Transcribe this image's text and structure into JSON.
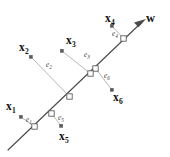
{
  "figure": {
    "background_color": "#ffffff",
    "width": 170,
    "height": 157,
    "axis_color": "#4a4a4a",
    "residual_color": "#b3b3b3",
    "marker_fill": "#ffffff",
    "marker_stroke": "#555555",
    "data_point_color": "#5c5c5c",
    "label_color": "#111111"
  },
  "principal_axis": {
    "name": "principal-axis",
    "label": "w",
    "has_arrowhead": true,
    "arrow_direction": "up-right",
    "start": {
      "x": 8,
      "y": 150
    },
    "end": {
      "x": 146,
      "y": 19
    }
  },
  "data_points": [
    {
      "id": "x1",
      "label": "x",
      "subscript": "1",
      "point": {
        "x": 21,
        "y": 117
      },
      "label_pos": {
        "x": 6,
        "y": 101
      },
      "projection": {
        "x": 35,
        "y": 127
      },
      "residual": {
        "label": "e",
        "subscript": "1",
        "pos": {
          "x": 26,
          "y": 117
        }
      }
    },
    {
      "id": "x2",
      "label": "x",
      "subscript": "2",
      "point": {
        "x": 31,
        "y": 57
      },
      "label_pos": {
        "x": 19,
        "y": 42
      },
      "projection": {
        "x": 70,
        "y": 97
      },
      "residual": {
        "label": "e",
        "subscript": "2",
        "pos": {
          "x": 46,
          "y": 62
        }
      }
    },
    {
      "id": "x3",
      "label": "x",
      "subscript": "3",
      "point": {
        "x": 62,
        "y": 51
      },
      "label_pos": {
        "x": 66,
        "y": 35
      },
      "projection": {
        "x": 91,
        "y": 74
      },
      "residual": {
        "label": "e",
        "subscript": "3",
        "pos": {
          "x": 84,
          "y": 52
        }
      }
    },
    {
      "id": "x4",
      "label": "x",
      "subscript": "4",
      "point": {
        "x": 112,
        "y": 26
      },
      "label_pos": {
        "x": 105,
        "y": 13
      },
      "projection": {
        "x": 124,
        "y": 39
      },
      "residual": {
        "label": "e",
        "subscript": "4",
        "pos": {
          "x": 112,
          "y": 31
        }
      }
    },
    {
      "id": "x5",
      "label": "x",
      "subscript": "5",
      "point": {
        "x": 61,
        "y": 126
      },
      "label_pos": {
        "x": 59,
        "y": 131
      },
      "projection": {
        "x": 52,
        "y": 114
      },
      "residual": {
        "label": "e",
        "subscript": "5",
        "pos": {
          "x": 58,
          "y": 115
        }
      }
    },
    {
      "id": "x6",
      "label": "x",
      "subscript": "6",
      "point": {
        "x": 112,
        "y": 90
      },
      "label_pos": {
        "x": 113,
        "y": 92
      },
      "projection": {
        "x": 96,
        "y": 69
      },
      "residual": {
        "label": "e",
        "subscript": "6",
        "pos": {
          "x": 104,
          "y": 73
        }
      }
    }
  ]
}
